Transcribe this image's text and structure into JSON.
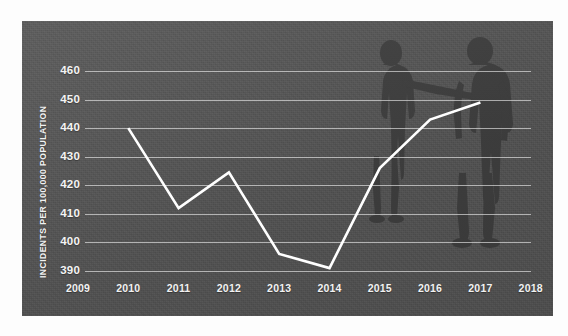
{
  "chart_data": {
    "type": "line",
    "title": "",
    "subtitle": "",
    "xlabel": "",
    "ylabel": "INCIDENTS PER 100,000 POPULATION",
    "categories": [
      "2009",
      "2010",
      "2011",
      "2012",
      "2013",
      "2014",
      "2015",
      "2016",
      "2017",
      "2018"
    ],
    "x_tick_labels": [
      "2009",
      "2010",
      "2011",
      "2012",
      "2013",
      "2014",
      "2015",
      "2016",
      "2017",
      "2018"
    ],
    "y_tick_labels": [
      "460",
      "450",
      "440",
      "430",
      "420",
      "410",
      "400",
      "390"
    ],
    "xlim": [
      "2009",
      "2018"
    ],
    "ylim": [
      385,
      465
    ],
    "grid": "horizontal",
    "legend": "none",
    "series": [
      {
        "name": "Incidents per 100,000 population",
        "color": "#ffffff",
        "points": [
          {
            "x": "2010",
            "y": 440
          },
          {
            "x": "2011",
            "y": 412
          },
          {
            "x": "2012",
            "y": 424.5
          },
          {
            "x": "2013",
            "y": 396
          },
          {
            "x": "2014",
            "y": 391
          },
          {
            "x": "2015",
            "y": 426
          },
          {
            "x": "2016",
            "y": 443
          },
          {
            "x": "2017",
            "y": 449
          }
        ]
      }
    ],
    "annotations": [
      {
        "name": "silhouette-figure-left",
        "description": "dark silhouette of a standing person holding a long object"
      },
      {
        "name": "silhouette-figure-right",
        "description": "dark silhouette of a standing person facing left"
      }
    ],
    "colors": {
      "panel_background": "#555555",
      "gridline": "#f0f0f0",
      "line": "#ffffff",
      "tick_label": "#f2f2f2",
      "silhouette": "#3f3f3f",
      "page_background": "#fdfdfd"
    }
  }
}
